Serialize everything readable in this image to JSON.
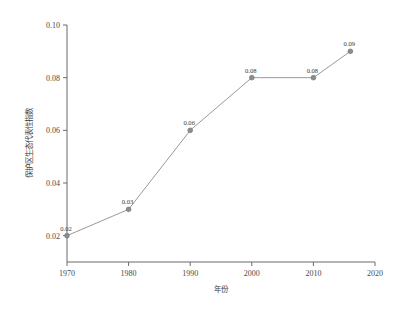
{
  "chart_data": {
    "type": "line",
    "title": "",
    "xlabel": "年份",
    "ylabel": "保护区生态代表性指数",
    "xlim": [
      1970,
      2020
    ],
    "ylim": [
      0.01,
      0.1
    ],
    "grid": false,
    "legend": false,
    "x": [
      1970,
      1980,
      1990,
      2000,
      2010,
      2016
    ],
    "values": [
      0.02,
      0.03,
      0.06,
      0.08,
      0.08,
      0.09
    ],
    "point_labels": [
      "0.02",
      "0.03",
      "0.06",
      "0.08",
      "0.08",
      "0.09"
    ],
    "xticks": [
      1970,
      1980,
      1990,
      2000,
      2010,
      2020
    ],
    "xtick_labels": [
      "1970",
      "1980",
      "1990",
      "2000",
      "2010",
      "2020"
    ],
    "yticks": [
      0.02,
      0.04,
      0.06,
      0.08,
      0.1
    ],
    "ytick_labels": [
      "0.02",
      "0.04",
      "0.06",
      "0.08",
      "0.10"
    ],
    "series_color": "#9a9a9a",
    "marker_color": "#8c8c8c",
    "axis_color": "#6b6b6b",
    "background_color": "#ffffff"
  }
}
